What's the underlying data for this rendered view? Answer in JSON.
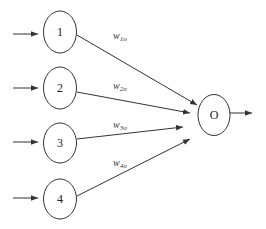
{
  "diagram": {
    "type": "single-layer-perceptron",
    "colors": {
      "stroke": "#333333",
      "background": "#ffffff"
    },
    "input_nodes": [
      {
        "id": "1",
        "label": "1",
        "cx": 60,
        "cy": 32
      },
      {
        "id": "2",
        "label": "2",
        "cx": 60,
        "cy": 88
      },
      {
        "id": "3",
        "label": "3",
        "cx": 60,
        "cy": 143
      },
      {
        "id": "4",
        "label": "4",
        "cx": 60,
        "cy": 199
      }
    ],
    "output_node": {
      "id": "O",
      "label": "O",
      "cx": 214,
      "cy": 116
    },
    "weights": [
      {
        "base": "w",
        "sub": "1o"
      },
      {
        "base": "w",
        "sub": "2o"
      },
      {
        "base": "w",
        "sub": "3o"
      },
      {
        "base": "w",
        "sub": "4o"
      }
    ]
  }
}
